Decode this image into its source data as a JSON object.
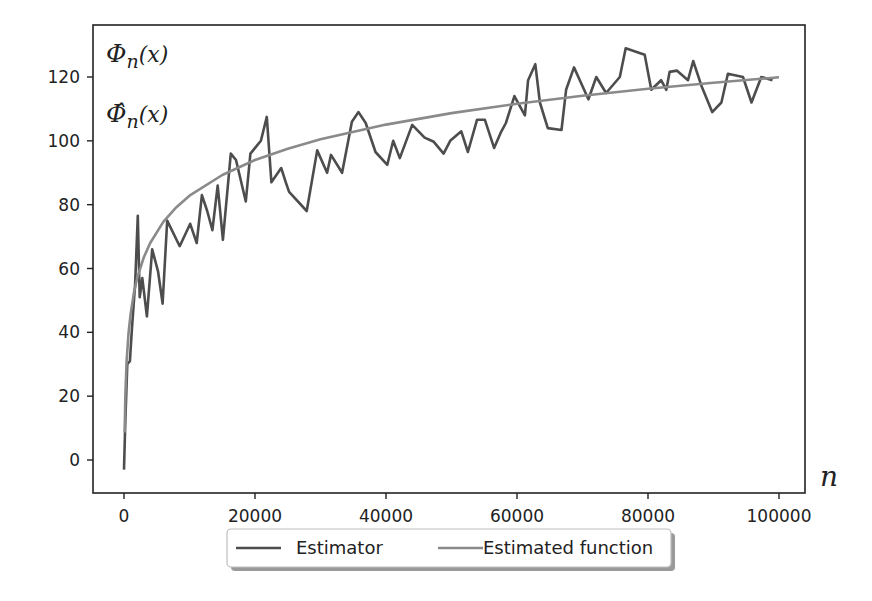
{
  "chart_data": {
    "type": "line",
    "title": "",
    "xlabel": "n",
    "ylabel": "",
    "annotations": [
      "Φ_n(x)",
      "Φ̂_n(x)"
    ],
    "xlim": [
      -5000,
      104000
    ],
    "ylim": [
      -10,
      136
    ],
    "xticks": [
      0,
      20000,
      40000,
      60000,
      80000,
      100000
    ],
    "xtick_labels": [
      "0",
      "20000",
      "40000",
      "60000",
      "80000",
      "100000"
    ],
    "yticks": [
      0,
      20,
      40,
      60,
      80,
      100,
      120
    ],
    "ytick_labels": [
      "0",
      "20",
      "40",
      "60",
      "80",
      "100",
      "120"
    ],
    "grid": false,
    "legend_position": "lower center (below axes)",
    "series": [
      {
        "name": "Estimator",
        "color": "#4d4d4d",
        "x": [
          0,
          200,
          500,
          900,
          1200,
          1700,
          2100,
          2400,
          2800,
          3500,
          4300,
          5200,
          5900,
          6600,
          8500,
          10100,
          11100,
          11900,
          12700,
          13500,
          14300,
          15100,
          16300,
          17100,
          18600,
          19300,
          20100,
          20900,
          21800,
          22500,
          24000,
          24700,
          25200,
          27900,
          29500,
          31000,
          31600,
          33300,
          34800,
          35800,
          36900,
          38400,
          40200,
          41100,
          42100,
          44000,
          45900,
          47300,
          48800,
          49800,
          51500,
          52500,
          53900,
          55100,
          56500,
          57500,
          58300,
          59600,
          61200,
          61700,
          62800,
          63500,
          64700,
          66800,
          67500,
          68700,
          70900,
          72100,
          73600,
          75700,
          76600,
          79500,
          80500,
          82000,
          82800,
          83300,
          84400,
          86100,
          86900,
          88200,
          89800,
          91200,
          92200,
          94500,
          95800,
          97300,
          99000
        ],
        "values": [
          -3,
          12,
          30,
          31,
          41,
          55,
          76.5,
          51,
          57,
          45,
          66,
          59,
          49,
          75,
          67,
          74,
          68,
          83,
          78,
          72,
          86,
          69,
          96,
          94,
          81,
          96,
          98,
          100,
          107.5,
          87,
          91.5,
          87,
          84,
          78,
          97,
          90,
          95.6,
          90,
          106,
          109,
          105.6,
          96.5,
          92.5,
          100,
          94.6,
          105,
          101,
          99.7,
          96,
          100,
          103,
          96.5,
          106.6,
          106.6,
          97.8,
          102.5,
          105.6,
          114,
          108,
          119,
          124,
          112,
          104,
          103.4,
          116,
          123,
          113,
          120,
          115,
          120,
          129,
          127,
          116,
          119,
          116,
          121.6,
          122,
          119,
          125,
          117,
          109,
          112,
          121,
          120,
          112,
          120,
          119
        ]
      },
      {
        "name": "Estimated function",
        "color": "#8a8a8a",
        "formula": "approx -65.5 + 16.1*ln(n)",
        "x": [
          100,
          200,
          400,
          700,
          1000,
          1500,
          2000,
          3000,
          4000,
          6000,
          8000,
          10000,
          15000,
          20000,
          25000,
          30000,
          40000,
          50000,
          60000,
          70000,
          80000,
          90000,
          100000
        ],
        "values": [
          8.6,
          19.8,
          31.0,
          40.0,
          45.7,
          52.2,
          56.9,
          63.4,
          68.0,
          74.6,
          79.2,
          82.8,
          89.3,
          94.0,
          97.5,
          100.5,
          105.1,
          108.7,
          111.6,
          114.1,
          116.3,
          118.2,
          119.9
        ]
      }
    ]
  },
  "axes": {
    "x_label": "n",
    "y_annotation_1": "Φ",
    "y_annotation_1_sub": "n",
    "y_annotation_1_arg": "(x)",
    "y_annotation_2": "Φ̂",
    "y_annotation_2_sub": "n",
    "y_annotation_2_arg": "(x)"
  },
  "legend": {
    "items": [
      {
        "label": "Estimator",
        "color": "#4d4d4d"
      },
      {
        "label": "Estimated function",
        "color": "#8a8a8a"
      }
    ]
  }
}
